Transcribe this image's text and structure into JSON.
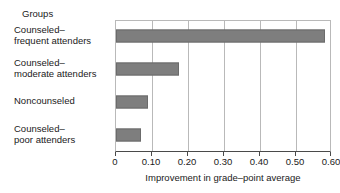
{
  "groups_header": "Groups",
  "chart_data": {
    "type": "bar",
    "orientation": "horizontal",
    "title": "",
    "xlabel": "Improvement in grade–point average",
    "ylabel": "Groups",
    "xlim": [
      0,
      0.6
    ],
    "xticks": [
      0,
      0.1,
      0.2,
      0.3,
      0.4,
      0.5,
      0.6
    ],
    "xticklabels": [
      "0",
      "0.10",
      "0.20",
      "0.30",
      "0.40",
      "0.50",
      "0.60"
    ],
    "grid": "vertical",
    "legend": "none",
    "bar_color": "#7e7e7e",
    "categories": [
      "Counseled—frequent attenders",
      "Counseled—moderate attenders",
      "Noncounseled",
      "Counseled—poor attenders"
    ],
    "category_lines": [
      [
        "Counseled–",
        "frequent attenders"
      ],
      [
        "Counseled–",
        "moderate attenders"
      ],
      [
        "Noncounseled",
        ""
      ],
      [
        "Counseled–",
        "poor attenders"
      ]
    ],
    "values": [
      0.58,
      0.175,
      0.09,
      0.07
    ]
  }
}
